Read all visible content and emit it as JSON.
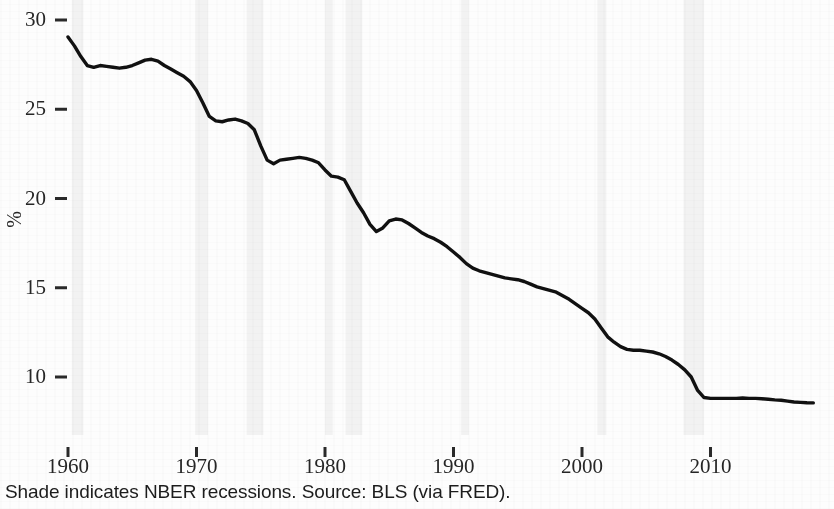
{
  "chart_data": {
    "type": "line",
    "title": "",
    "subtitle": "",
    "xlabel": "",
    "ylabel": "%",
    "xlim": [
      1959.5,
      2018.5
    ],
    "ylim": [
      7.6,
      30.6
    ],
    "grid": false,
    "legend": null,
    "caption": "Shade indicates NBER recessions. Source: BLS (via FRED).",
    "x_ticks": [
      "1960",
      "1970",
      "1980",
      "1990",
      "2000",
      "2010"
    ],
    "x_tick_values": [
      1960,
      1970,
      1980,
      1990,
      2000,
      2010
    ],
    "y_ticks": [
      "10",
      "15",
      "20",
      "25",
      "30"
    ],
    "y_tick_values": [
      10,
      15,
      20,
      25,
      30
    ],
    "line_color": "#111111",
    "shade_color": "#f2f2f2",
    "series": [
      {
        "name": "Manufacturing share of employment",
        "x": [
          1960.0,
          1960.5,
          1961.0,
          1961.5,
          1962.0,
          1962.5,
          1963.0,
          1963.5,
          1964.0,
          1964.5,
          1965.0,
          1965.5,
          1966.0,
          1966.5,
          1967.0,
          1967.5,
          1968.0,
          1968.5,
          1969.0,
          1969.5,
          1970.0,
          1970.5,
          1971.0,
          1971.5,
          1972.0,
          1972.5,
          1973.0,
          1973.5,
          1974.0,
          1974.5,
          1975.0,
          1975.5,
          1976.0,
          1976.5,
          1977.0,
          1977.5,
          1978.0,
          1978.5,
          1979.0,
          1979.5,
          1980.0,
          1980.5,
          1981.0,
          1981.5,
          1982.0,
          1982.5,
          1983.0,
          1983.5,
          1984.0,
          1984.5,
          1985.0,
          1985.5,
          1986.0,
          1986.5,
          1987.0,
          1987.5,
          1988.0,
          1988.5,
          1989.0,
          1989.5,
          1990.0,
          1990.5,
          1991.0,
          1991.5,
          1992.0,
          1992.5,
          1993.0,
          1993.5,
          1994.0,
          1994.5,
          1995.0,
          1995.5,
          1996.0,
          1996.5,
          1997.0,
          1997.5,
          1998.0,
          1998.5,
          1999.0,
          1999.5,
          2000.0,
          2000.5,
          2001.0,
          2001.5,
          2002.0,
          2002.5,
          2003.0,
          2003.5,
          2004.0,
          2004.5,
          2005.0,
          2005.5,
          2006.0,
          2006.5,
          2007.0,
          2007.5,
          2008.0,
          2008.5,
          2009.0,
          2009.5,
          2010.0,
          2010.5,
          2011.0,
          2011.5,
          2012.0,
          2012.5,
          2013.0,
          2013.5,
          2014.0,
          2014.5,
          2015.0,
          2015.5,
          2016.0,
          2016.5,
          2017.0,
          2017.5,
          2018.0
        ],
        "y": [
          29.05,
          28.55,
          27.95,
          27.45,
          27.35,
          27.45,
          27.4,
          27.35,
          27.3,
          27.35,
          27.45,
          27.6,
          27.75,
          27.8,
          27.7,
          27.45,
          27.25,
          27.05,
          26.85,
          26.55,
          26.05,
          25.35,
          24.6,
          24.35,
          24.3,
          24.4,
          24.45,
          24.35,
          24.2,
          23.85,
          22.95,
          22.15,
          21.95,
          22.15,
          22.2,
          22.25,
          22.3,
          22.25,
          22.15,
          22.0,
          21.6,
          21.25,
          21.2,
          21.05,
          20.4,
          19.75,
          19.2,
          18.55,
          18.15,
          18.35,
          18.75,
          18.85,
          18.8,
          18.6,
          18.35,
          18.1,
          17.9,
          17.75,
          17.55,
          17.3,
          17.0,
          16.7,
          16.35,
          16.1,
          15.95,
          15.85,
          15.75,
          15.65,
          15.55,
          15.5,
          15.45,
          15.35,
          15.2,
          15.05,
          14.95,
          14.85,
          14.75,
          14.55,
          14.35,
          14.1,
          13.85,
          13.6,
          13.25,
          12.75,
          12.25,
          11.95,
          11.7,
          11.55,
          11.5,
          11.5,
          11.45,
          11.4,
          11.3,
          11.15,
          10.95,
          10.7,
          10.4,
          10.0,
          9.25,
          8.85,
          8.8,
          8.8,
          8.8,
          8.8,
          8.8,
          8.82,
          8.8,
          8.8,
          8.78,
          8.75,
          8.72,
          8.7,
          8.65,
          8.6,
          8.58,
          8.56,
          8.55
        ]
      }
    ],
    "recession_bands": [
      {
        "start": 1960.3,
        "end": 1961.2
      },
      {
        "start": 1969.9,
        "end": 1970.9
      },
      {
        "start": 1973.9,
        "end": 1975.2
      },
      {
        "start": 1980.0,
        "end": 1980.6
      },
      {
        "start": 1981.6,
        "end": 1982.9
      },
      {
        "start": 1990.6,
        "end": 1991.2
      },
      {
        "start": 2001.2,
        "end": 2001.9
      },
      {
        "start": 2007.9,
        "end": 2009.5
      }
    ]
  },
  "axes": {
    "y_title": "%",
    "y_labels": [
      "30",
      "25",
      "20",
      "15",
      "10"
    ],
    "x_labels": [
      "1960",
      "1970",
      "1980",
      "1990",
      "2000",
      "2010"
    ]
  },
  "footer": {
    "caption": "Shade indicates NBER recessions. Source: BLS (via FRED)."
  }
}
